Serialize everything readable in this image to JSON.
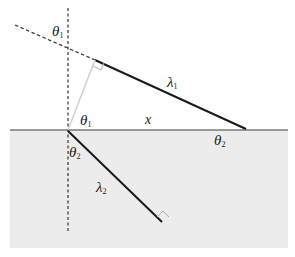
{
  "diagram": {
    "type": "refraction-wavefront-geometry",
    "colors": {
      "background": "#ffffff",
      "lower_medium": "#ececec",
      "interface": "#7a7a7a",
      "solid_line": "#1a1a1a",
      "dashed_line": "#333333",
      "perpendicular": "#d0d0d0",
      "right_angle_marker": "#b0b0b0"
    },
    "labels": {
      "theta1_top": {
        "symbol": "θ",
        "sub": "1"
      },
      "lambda1": {
        "symbol": "λ",
        "sub": "1"
      },
      "theta1_mid": {
        "symbol": "θ",
        "sub": "1"
      },
      "x": {
        "symbol": "x"
      },
      "theta2_right": {
        "symbol": "θ",
        "sub": "2"
      },
      "theta2_lower": {
        "symbol": "θ",
        "sub": "2"
      },
      "lambda2": {
        "symbol": "λ",
        "sub": "2"
      }
    },
    "geometry": {
      "interface": {
        "x1": 10,
        "y1": 130,
        "x2": 288,
        "y2": 130
      },
      "normal_dashed": {
        "x1": 68,
        "y1": 8,
        "x2": 68,
        "y2": 232
      },
      "incident_dashed": {
        "x1": 15,
        "y1": 25,
        "x2": 95,
        "y2": 60
      },
      "lambda1_segment": {
        "x1": 95,
        "y1": 60,
        "x2": 246,
        "y2": 129
      },
      "perpendicular": {
        "x1": 68,
        "y1": 130,
        "x2": 95,
        "y2": 60
      },
      "lambda2_segment": {
        "x1": 68,
        "y1": 131,
        "x2": 162,
        "y2": 222
      },
      "lower_medium_rect": {
        "x": 10,
        "y": 130,
        "width": 278,
        "height": 118
      }
    }
  }
}
